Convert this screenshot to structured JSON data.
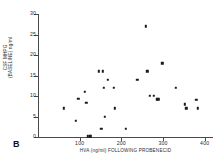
{
  "figure": {
    "panel_label": "B",
    "background_color": "#ffffff",
    "axis_color": "#4a4a4a",
    "marker_color": "#1a1a1a"
  },
  "chart_data": {
    "type": "scatter",
    "title": "",
    "xlabel": "HVA (ng/ml) FOLLOWING PROBENECID",
    "ylabel_line1": "CSF MHPG",
    "ylabel_line2": "(BASELINE) ng/ml",
    "xlim": [
      0,
      420
    ],
    "ylim": [
      0,
      30
    ],
    "xticks": [
      100,
      200,
      300,
      400
    ],
    "xticklabels": [
      "100",
      "200",
      "300",
      "400"
    ],
    "yticks": [
      0,
      5,
      10,
      15,
      20,
      25,
      30
    ],
    "yticklabels": [
      "0",
      "5",
      "10",
      "15",
      "20",
      "25",
      "30"
    ],
    "grid": false,
    "legend": false,
    "marker": "square",
    "points": [
      {
        "x": 62,
        "y": 7
      },
      {
        "x": 90,
        "y": 4
      },
      {
        "x": 97,
        "y": 9.3
      },
      {
        "x": 113,
        "y": 11
      },
      {
        "x": 116,
        "y": 8.3
      },
      {
        "x": 119,
        "y": 0.2
      },
      {
        "x": 124,
        "y": 0.2
      },
      {
        "x": 127,
        "y": 0.2
      },
      {
        "x": 146,
        "y": 16
      },
      {
        "x": 152,
        "y": 2
      },
      {
        "x": 156,
        "y": 16
      },
      {
        "x": 158,
        "y": 12
      },
      {
        "x": 161,
        "y": 5
      },
      {
        "x": 168,
        "y": 14
      },
      {
        "x": 182,
        "y": 12
      },
      {
        "x": 184,
        "y": 7
      },
      {
        "x": 210,
        "y": 2
      },
      {
        "x": 238,
        "y": 14
      },
      {
        "x": 258,
        "y": 27
      },
      {
        "x": 262,
        "y": 16
      },
      {
        "x": 268,
        "y": 10
      },
      {
        "x": 278,
        "y": 10
      },
      {
        "x": 285,
        "y": 9.2
      },
      {
        "x": 289,
        "y": 9.2
      },
      {
        "x": 298,
        "y": 18
      },
      {
        "x": 330,
        "y": 12
      },
      {
        "x": 352,
        "y": 8
      },
      {
        "x": 356,
        "y": 7
      },
      {
        "x": 380,
        "y": 9
      },
      {
        "x": 383,
        "y": 7
      }
    ]
  }
}
